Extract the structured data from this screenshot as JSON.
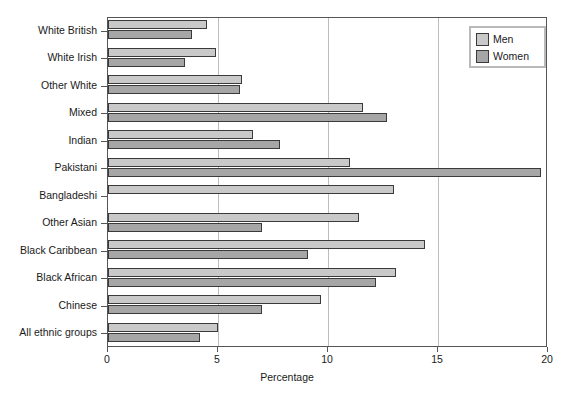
{
  "chart_data": {
    "type": "bar",
    "orientation": "horizontal",
    "title": "",
    "xlabel": "Percentage",
    "ylabel": "",
    "xlim": [
      0,
      20
    ],
    "xticks": [
      0,
      5,
      10,
      15,
      20
    ],
    "xtick_labels": [
      "0",
      "5",
      "10",
      "15",
      "20"
    ],
    "grid": "vertical gridlines at 5, 10, 15",
    "legend_position": "top-right",
    "categories": [
      "White British",
      "White Irish",
      "Other White",
      "Mixed",
      "Indian",
      "Pakistani",
      "Bangladeshi",
      "Other Asian",
      "Black Caribbean",
      "Black African",
      "Chinese",
      "All ethnic groups"
    ],
    "series": [
      {
        "name": "Men",
        "color": "#c9c9c9",
        "values": [
          4.5,
          4.9,
          6.1,
          11.6,
          6.6,
          11.0,
          13.0,
          11.4,
          14.4,
          13.1,
          9.7,
          5.0
        ]
      },
      {
        "name": "Women",
        "color": "#a6a6a6",
        "values": [
          3.8,
          3.5,
          6.0,
          12.7,
          7.8,
          19.7,
          0,
          7.0,
          9.1,
          12.2,
          7.0,
          4.2
        ]
      }
    ]
  },
  "legend": {
    "entries": [
      {
        "label": "Men",
        "swatch": "men-swatch"
      },
      {
        "label": "Women",
        "swatch": "women-swatch"
      }
    ]
  },
  "axis": {
    "x_title": "Percentage"
  }
}
